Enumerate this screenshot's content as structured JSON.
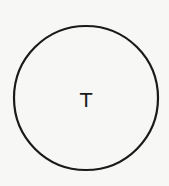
{
  "diagram": {
    "nodes": [
      {
        "id": "T",
        "label": "T",
        "shape": "circle",
        "cx": 86,
        "cy": 98,
        "r": 72,
        "stroke": "#1a1a1a",
        "fill": "none"
      }
    ]
  },
  "colors": {
    "background": "#f7f7f5",
    "stroke": "#1a1a1a",
    "text": "#1a1a1a"
  }
}
